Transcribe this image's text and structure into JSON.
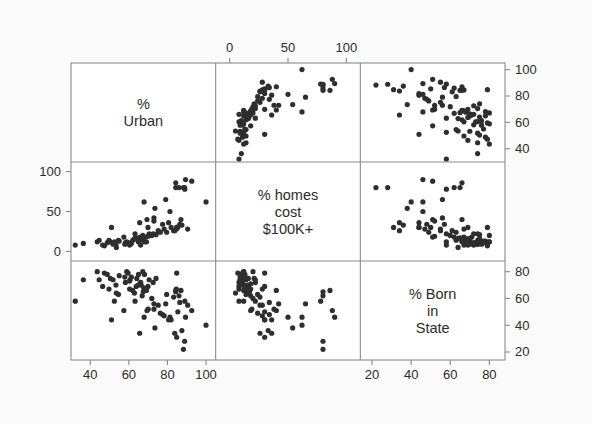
{
  "figure": {
    "type": "scatterplot-matrix",
    "background_color": "#fafafa",
    "panel_background": "#ffffff",
    "frame_color": "#8a8a8a",
    "point_color": "#2e2e2e",
    "text_color": "#2b2b2b",
    "point_radius": 2.6,
    "plot_area": {
      "left": 71,
      "top": 63,
      "right": 505,
      "bottom": 360
    }
  },
  "chart_data": {
    "type": "scatter",
    "title": "",
    "subtitle": "",
    "matrix": true,
    "grid": false,
    "legend": "none",
    "variables": [
      {
        "key": "urban",
        "label": "%\nUrban",
        "label_flat": "% Urban",
        "axis_ticks": [
          40,
          60,
          80,
          100
        ],
        "range": [
          30,
          105
        ],
        "axis_side_row": "right",
        "axis_side_col": "bottom"
      },
      {
        "key": "homes100k",
        "label": "% homes\ncost\n$100K+",
        "label_flat": "% homes cost $100K+",
        "axis_ticks": [
          0,
          50,
          100
        ],
        "range": [
          -12,
          112
        ],
        "axis_side_row": "left",
        "axis_side_col": "top"
      },
      {
        "key": "bornstate",
        "label": "% Born\nin\nState",
        "label_flat": "% Born in State",
        "axis_ticks": [
          20,
          40,
          60,
          80
        ],
        "range": [
          14,
          88
        ],
        "axis_side_row": "right",
        "axis_side_col": "bottom"
      }
    ],
    "xlabel": "",
    "ylabel": "",
    "points": [
      {
        "urban": 60.4,
        "homes100k": 8,
        "bornstate": 67
      },
      {
        "urban": 65.6,
        "homes100k": 36,
        "bornstate": 34
      },
      {
        "urban": 83.8,
        "homes100k": 26,
        "bornstate": 34
      },
      {
        "urban": 53.5,
        "homes100k": 5,
        "bornstate": 64
      },
      {
        "urban": 92.6,
        "homes100k": 88,
        "bornstate": 51
      },
      {
        "urban": 80.6,
        "homes100k": 36,
        "bornstate": 44
      },
      {
        "urban": 79.1,
        "homes100k": 65,
        "bornstate": 56
      },
      {
        "urban": 73.0,
        "homes100k": 42,
        "bornstate": 56
      },
      {
        "urban": 84.8,
        "homes100k": 30,
        "bornstate": 31
      },
      {
        "urban": 63.2,
        "homes100k": 22,
        "bornstate": 58
      },
      {
        "urban": 89.0,
        "homes100k": 78,
        "bornstate": 58
      },
      {
        "urban": 57.4,
        "homes100k": 18,
        "bornstate": 51
      },
      {
        "urban": 84.6,
        "homes100k": 28,
        "bornstate": 67
      },
      {
        "urban": 64.9,
        "homes100k": 12,
        "bornstate": 70
      },
      {
        "urban": 60.6,
        "homes100k": 9,
        "bornstate": 74
      },
      {
        "urban": 69.1,
        "homes100k": 12,
        "bornstate": 66
      },
      {
        "urban": 51.8,
        "homes100k": 9,
        "bornstate": 74
      },
      {
        "urban": 68.1,
        "homes100k": 12,
        "bornstate": 78
      },
      {
        "urban": 44.6,
        "homes100k": 14,
        "bornstate": 74
      },
      {
        "urban": 81.3,
        "homes100k": 50,
        "bornstate": 46
      },
      {
        "urban": 84.3,
        "homes100k": 86,
        "bornstate": 66
      },
      {
        "urban": 70.5,
        "homes100k": 22,
        "bornstate": 74
      },
      {
        "urban": 69.9,
        "homes100k": 30,
        "bornstate": 69
      },
      {
        "urban": 47.3,
        "homes100k": 7,
        "bornstate": 79
      },
      {
        "urban": 68.7,
        "homes100k": 18,
        "bornstate": 67
      },
      {
        "urban": 52.5,
        "homes100k": 12,
        "bornstate": 58
      },
      {
        "urban": 66.1,
        "homes100k": 8,
        "bornstate": 72
      },
      {
        "urban": 88.3,
        "homes100k": 80,
        "bornstate": 22
      },
      {
        "urban": 51.0,
        "homes100k": 30,
        "bornstate": 44
      },
      {
        "urban": 89.4,
        "homes100k": 90,
        "bornstate": 46
      },
      {
        "urban": 73.0,
        "homes100k": 38,
        "bornstate": 52
      },
      {
        "urban": 84.3,
        "homes100k": 80,
        "bornstate": 65
      },
      {
        "urban": 50.4,
        "homes100k": 12,
        "bornstate": 75
      },
      {
        "urban": 53.3,
        "homes100k": 9,
        "bornstate": 70
      },
      {
        "urban": 74.1,
        "homes100k": 21,
        "bornstate": 75
      },
      {
        "urban": 67.7,
        "homes100k": 13,
        "bornstate": 68
      },
      {
        "urban": 67.9,
        "homes100k": 62,
        "bornstate": 46
      },
      {
        "urban": 84.8,
        "homes100k": 30,
        "bornstate": 79
      },
      {
        "urban": 86.0,
        "homes100k": 80,
        "bornstate": 62
      },
      {
        "urban": 54.6,
        "homes100k": 14,
        "bornstate": 63
      },
      {
        "urban": 46.4,
        "homes100k": 8,
        "bornstate": 69
      },
      {
        "urban": 60.4,
        "homes100k": 10,
        "bornstate": 73
      },
      {
        "urban": 79.6,
        "homes100k": 24,
        "bornstate": 63
      },
      {
        "urban": 87.0,
        "homes100k": 40,
        "bornstate": 66
      },
      {
        "urban": 32.2,
        "homes100k": 8,
        "bornstate": 58
      },
      {
        "urban": 69.4,
        "homes100k": 40,
        "bornstate": 51
      },
      {
        "urban": 73.5,
        "homes100k": 54,
        "bornstate": 38
      },
      {
        "urban": 36.4,
        "homes100k": 10,
        "bornstate": 74
      },
      {
        "urban": 65.7,
        "homes100k": 18,
        "bornstate": 71
      },
      {
        "urban": 62.9,
        "homes100k": 16,
        "bornstate": 64
      },
      {
        "urban": 100.0,
        "homes100k": 62,
        "bornstate": 40
      },
      {
        "urban": 67.4,
        "homes100k": 17,
        "bornstate": 65
      },
      {
        "urban": 71.9,
        "homes100k": 20,
        "bornstate": 60
      },
      {
        "urban": 66.4,
        "homes100k": 15,
        "bornstate": 70
      },
      {
        "urban": 58.2,
        "homes100k": 11,
        "bornstate": 72
      },
      {
        "urban": 75.2,
        "homes100k": 26,
        "bornstate": 55
      },
      {
        "urban": 61.3,
        "homes100k": 10,
        "bornstate": 76
      },
      {
        "urban": 48.8,
        "homes100k": 11,
        "bornstate": 78
      },
      {
        "urban": 90.5,
        "homes100k": 28,
        "bornstate": 55
      },
      {
        "urban": 77.5,
        "homes100k": 34,
        "bornstate": 48
      },
      {
        "urban": 63.8,
        "homes100k": 16,
        "bornstate": 69
      },
      {
        "urban": 55.0,
        "homes100k": 13,
        "bornstate": 77
      },
      {
        "urban": 86.4,
        "homes100k": 34,
        "bornstate": 57
      },
      {
        "urban": 58.9,
        "homes100k": 12,
        "bornstate": 80
      },
      {
        "urban": 70.0,
        "homes100k": 19,
        "bornstate": 52
      },
      {
        "urban": 81.9,
        "homes100k": 30,
        "bornstate": 44
      },
      {
        "urban": 88.9,
        "homes100k": 80,
        "bornstate": 28
      },
      {
        "urban": 76.3,
        "homes100k": 24,
        "bornstate": 49
      },
      {
        "urban": 64.1,
        "homes100k": 16,
        "bornstate": 75
      },
      {
        "urban": 67.2,
        "homes100k": 20,
        "bornstate": 80
      },
      {
        "urban": 59.6,
        "homes100k": 11,
        "bornstate": 79
      },
      {
        "urban": 85.4,
        "homes100k": 30,
        "bornstate": 50
      },
      {
        "urban": 83.2,
        "homes100k": 26,
        "bornstate": 61
      },
      {
        "urban": 62.0,
        "homes100k": 14,
        "bornstate": 66
      },
      {
        "urban": 65.0,
        "homes100k": 13,
        "bornstate": 78
      },
      {
        "urban": 72.6,
        "homes100k": 22,
        "bornstate": 72
      },
      {
        "urban": 43.6,
        "homes100k": 12,
        "bornstate": 80
      },
      {
        "urban": 57.9,
        "homes100k": 9,
        "bornstate": 76
      },
      {
        "urban": 49.7,
        "homes100k": 14,
        "bornstate": 67
      },
      {
        "urban": 78.3,
        "homes100k": 28,
        "bornstate": 47
      },
      {
        "urban": 87.5,
        "homes100k": 33,
        "bornstate": 36
      },
      {
        "urban": 66.9,
        "homes100k": 18,
        "bornstate": 62
      }
    ]
  }
}
